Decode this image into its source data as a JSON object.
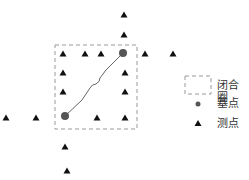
{
  "diagram": {
    "closure_box": {
      "x": 55,
      "y": 45,
      "w": 82,
      "h": 84,
      "stroke": "#999999"
    },
    "base_points": [
      {
        "x": 65,
        "y": 116
      },
      {
        "x": 123,
        "y": 53
      }
    ],
    "survey_points": [
      {
        "x": 124,
        "y": 15
      },
      {
        "x": 124,
        "y": 35
      },
      {
        "x": 63,
        "y": 54
      },
      {
        "x": 85,
        "y": 54
      },
      {
        "x": 101,
        "y": 54
      },
      {
        "x": 145,
        "y": 54
      },
      {
        "x": 173,
        "y": 54
      },
      {
        "x": 63,
        "y": 73
      },
      {
        "x": 125,
        "y": 73
      },
      {
        "x": 63,
        "y": 92
      },
      {
        "x": 125,
        "y": 92
      },
      {
        "x": 6,
        "y": 118
      },
      {
        "x": 36,
        "y": 118
      },
      {
        "x": 97,
        "y": 118
      },
      {
        "x": 125,
        "y": 118
      },
      {
        "x": 65,
        "y": 147
      },
      {
        "x": 67,
        "y": 171
      }
    ],
    "path_color": "#666666",
    "base_color": "#555555",
    "survey_color": "#111111"
  },
  "legend": {
    "closure_label": "闭合圈",
    "base_label": "基点",
    "survey_label": "测点"
  }
}
